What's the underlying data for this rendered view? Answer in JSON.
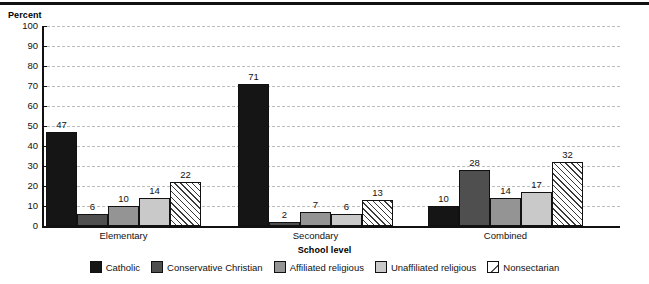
{
  "chart_data": {
    "type": "bar",
    "title": "",
    "xlabel": "School level",
    "ylabel": "Percent",
    "ylim": [
      0,
      100
    ],
    "yticks": [
      0,
      10,
      20,
      30,
      40,
      50,
      60,
      70,
      80,
      90,
      100
    ],
    "grid": true,
    "legend_position": "bottom",
    "categories": [
      "Elementary",
      "Secondary",
      "Combined"
    ],
    "series": [
      {
        "name": "Catholic",
        "color": "#151515",
        "values": [
          47,
          71,
          10
        ]
      },
      {
        "name": "Conservative Christian",
        "color": "#4f4f4f",
        "values": [
          6,
          2,
          28
        ]
      },
      {
        "name": "Affiliated religious",
        "color": "#949494",
        "values": [
          10,
          7,
          14
        ]
      },
      {
        "name": "Unaffiliated religious",
        "color": "#c9c9c9",
        "values": [
          14,
          6,
          17
        ]
      },
      {
        "name": "Nonsectarian",
        "color": "#ffffff",
        "pattern": "diagonal-hatch",
        "values": [
          22,
          13,
          32
        ]
      }
    ]
  },
  "axes": {
    "y_title": "Percent",
    "x_title": "School level",
    "y_ticks": [
      "100",
      "90",
      "80",
      "70",
      "60",
      "50",
      "40",
      "30",
      "20",
      "10",
      "0"
    ]
  },
  "groups": [
    {
      "label": "Elementary"
    },
    {
      "label": "Secondary"
    },
    {
      "label": "Combined"
    }
  ],
  "legend": {
    "items": [
      {
        "label": "Catholic",
        "swatch": "catholic"
      },
      {
        "label": "Conservative Christian",
        "swatch": "conservative"
      },
      {
        "label": "Affiliated religious",
        "swatch": "affiliated"
      },
      {
        "label": "Unaffiliated religious",
        "swatch": "unaffiliated"
      },
      {
        "label": "Nonsectarian",
        "swatch": "nonsectarian"
      }
    ]
  }
}
